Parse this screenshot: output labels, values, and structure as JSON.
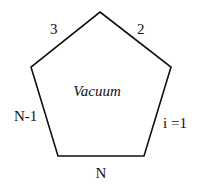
{
  "diagram": {
    "shape": "pentagon",
    "center_label": "Vacuum",
    "side_labels": {
      "top_left": "3",
      "top_right": "2",
      "bottom_left": "N-1",
      "bottom_right": "i =1",
      "bottom": "N"
    },
    "stroke_color": "#111111"
  }
}
